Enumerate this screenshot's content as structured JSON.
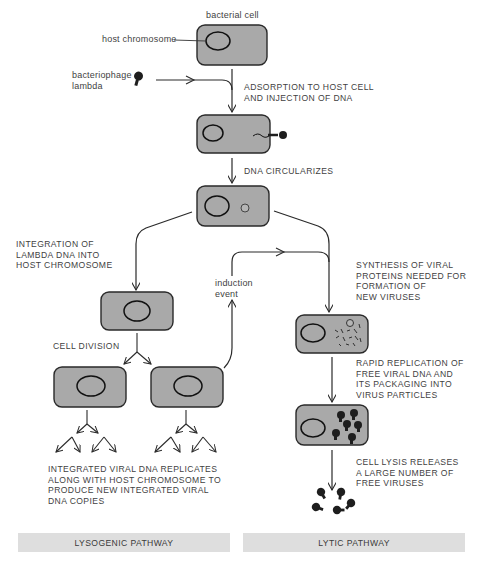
{
  "labels": {
    "bacterial_cell": "bacterial cell",
    "host_chromosome": "host chromosome",
    "bacteriophage": "bacteriophage\nlambda",
    "adsorption": "ADSORPTION TO HOST CELL\nAND INJECTION OF DNA",
    "circularizes": "DNA CIRCULARIZES",
    "integration": "INTEGRATION OF\nLAMBDA DNA INTO\nHOST CHROMOSOME",
    "induction": "induction\nevent",
    "synthesis": "SYNTHESIS OF VIRAL\nPROTEINS NEEDED FOR\nFORMATION OF\nNEW VIRUSES",
    "cell_division": "CELL DIVISION",
    "rapid_replication": "RAPID REPLICATION OF\nFREE VIRAL DNA AND\nITS PACKAGING INTO\nVIRUS PARTICLES",
    "lysis": "CELL LYSIS RELEASES\nA LARGE NUMBER OF\nFREE VIRUSES",
    "integrated_replicates": "INTEGRATED VIRAL DNA REPLICATES\nALONG WITH HOST CHROMOSOME TO\nPRODUCE NEW INTEGRATED VIRAL\nDNA COPIES"
  },
  "pathways": {
    "lysogenic": "LYSOGENIC PATHWAY",
    "lytic": "LYTIC PATHWAY"
  },
  "colors": {
    "cell_fill": "#a9a9a9",
    "cell_stroke": "#2a2a2a",
    "pathway_bar": "#dedede",
    "virus": "#1e1e1e"
  }
}
